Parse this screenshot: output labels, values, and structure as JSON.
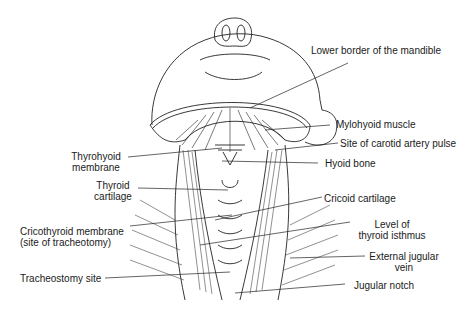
{
  "diagram": {
    "labels": {
      "lower_border_mandible": "Lower border of the mandible",
      "mylohyoid_muscle": "Mylohyoid muscle",
      "carotid_pulse": "Site of carotid artery pulse",
      "hyoid_bone": "Hyoid bone",
      "thyrohyoid_line1": "Thyrohyoid",
      "thyrohyoid_line2": "membrane",
      "thyroid_cart_line1": "Thyroid",
      "thyroid_cart_line2": "cartilage",
      "cricoid_cartilage": "Cricoid cartilage",
      "cricothyroid_line1": "Cricothyroid membrane",
      "cricothyroid_line2": "(site of tracheotomy)",
      "thyroid_isthmus_line1": "Level of",
      "thyroid_isthmus_line2": "thyroid isthmus",
      "ext_jugular_line1": "External jugular",
      "ext_jugular_line2": "vein",
      "tracheostomy_site": "Tracheostomy site",
      "jugular_notch": "Jugular notch"
    },
    "colors": {
      "ink": "#1a1a1a",
      "background": "#ffffff"
    }
  }
}
